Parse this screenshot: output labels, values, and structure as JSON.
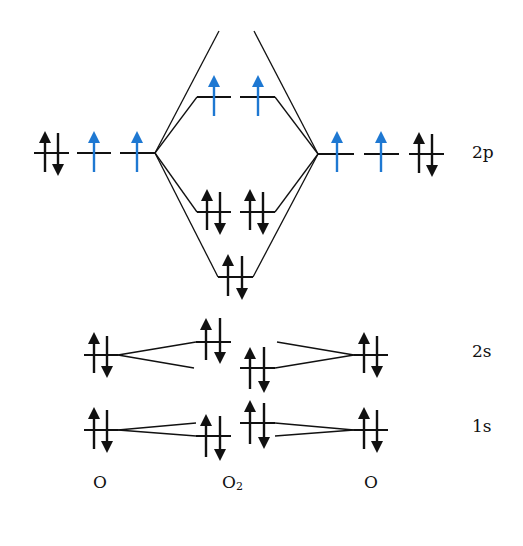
{
  "colors": {
    "line": "#111111",
    "paired_electron": "#111111",
    "unpaired_electron": "#1e78d2",
    "background": "#ffffff"
  },
  "energy_levels": {
    "2p": "2p",
    "2s": "2s",
    "1s": "1s"
  },
  "columns": {
    "left_atom": "O",
    "molecule": "O",
    "molecule_subscript": "2",
    "right_atom": "O"
  },
  "orbitals": {
    "left_atom": {
      "2p": [
        "paired",
        "up",
        "up"
      ],
      "2s": [
        "paired"
      ],
      "1s": [
        "paired"
      ]
    },
    "right_atom": {
      "2p": [
        "up",
        "up",
        "paired"
      ],
      "2s": [
        "paired"
      ],
      "1s": [
        "paired"
      ]
    },
    "molecule": {
      "sigma_star_2p": "empty",
      "pi_star_2p": [
        "up",
        "up"
      ],
      "pi_2p": [
        "paired",
        "paired"
      ],
      "sigma_2p": [
        "paired"
      ],
      "sigma_star_2s": [
        "paired"
      ],
      "sigma_2s": [
        "paired"
      ],
      "sigma_star_1s": [
        "paired"
      ],
      "sigma_1s": [
        "paired"
      ]
    }
  }
}
